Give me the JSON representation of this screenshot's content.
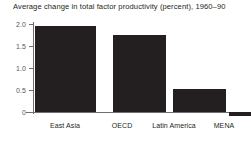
{
  "chart_data": {
    "type": "bar",
    "title": "Average change in total factor productivity (percent), 1960–90",
    "xlabel": "",
    "ylabel": "",
    "categories": [
      "East Asia",
      "OECD",
      "Latin America",
      "MENA"
    ],
    "values": [
      1.95,
      1.75,
      0.52,
      -0.1
    ],
    "ylim": [
      -0.25,
      2.0
    ],
    "yticks": [
      "0",
      "0.5",
      "1.0",
      "1.5",
      "2.0"
    ],
    "ytick_values": [
      0,
      0.5,
      1.0,
      1.5,
      2.0
    ],
    "grid": false,
    "legend": null,
    "bar_color": "#231f20",
    "axis_color": "#6f6f6f",
    "background": "#ffffff"
  },
  "axis": {
    "y_labels": [
      {
        "text": "2.0",
        "value": 2.0
      },
      {
        "text": "1.5",
        "value": 1.5
      },
      {
        "text": "1.0",
        "value": 1.0
      },
      {
        "text": "0.5",
        "value": 0.5
      },
      {
        "text": "0",
        "value": 0
      }
    ]
  },
  "bars": [
    {
      "label": "East Asia",
      "value": 1.95
    },
    {
      "label": "OECD",
      "value": 1.75
    },
    {
      "label": "Latin America",
      "value": 0.52
    },
    {
      "label": "MENA",
      "value": -0.1
    }
  ]
}
